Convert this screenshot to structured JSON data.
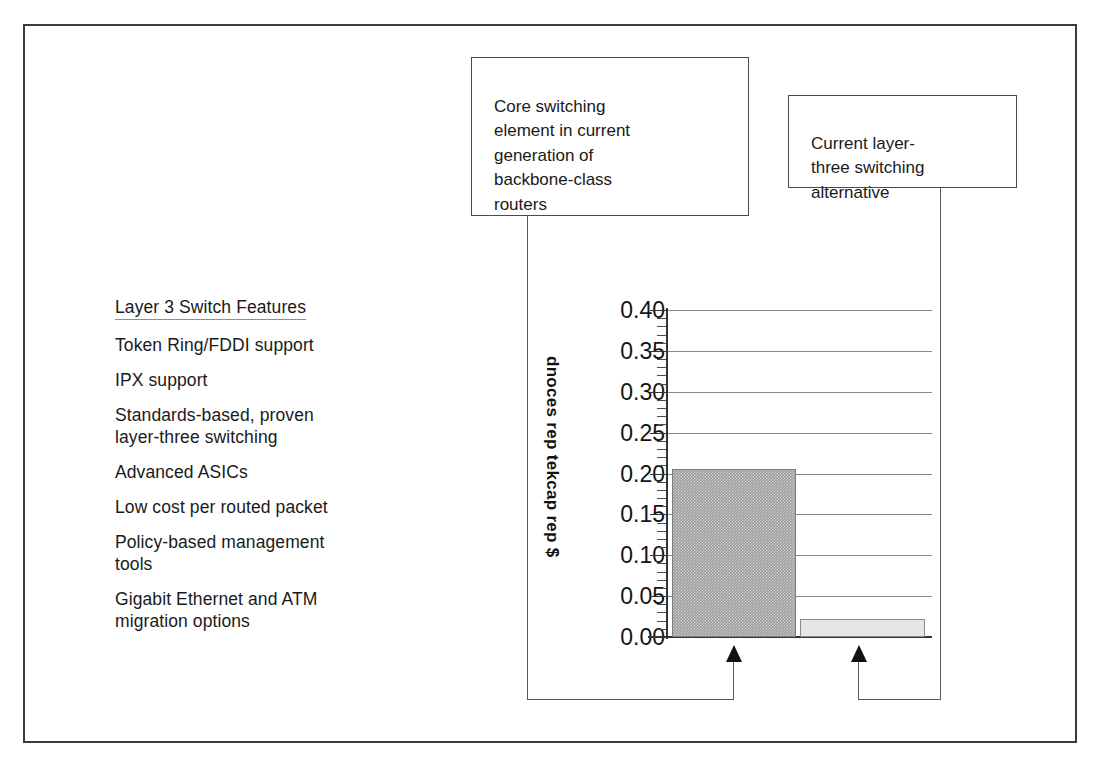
{
  "slide": {
    "background_color": "#ffffff",
    "frame_color": "#3b3b3b"
  },
  "feature_list": {
    "heading": "Layer 3 Switch Features",
    "items": [
      "Token Ring/FDDI support",
      "IPX support",
      "Standards-based, proven\nlayer-three switching",
      "Advanced    ASICs",
      "Low cost per routed packet",
      "Policy-based management\ntools",
      "Gigabit Ethernet and ATM\nmigration options"
    ]
  },
  "callouts": [
    {
      "id": "core",
      "text": "Core switching\nelement in current\ngeneration of\nbackbone-class\nrouters"
    },
    {
      "id": "current",
      "text": "Current layer-\nthree switching\nalternative"
    }
  ],
  "chart_data": {
    "type": "bar",
    "title": "",
    "xlabel": "",
    "ylabel": "dnoces rep tekcap rep $",
    "ylabel_reading": "$ per packet per second",
    "ylim": [
      0.0,
      0.4
    ],
    "ytick_step": 0.05,
    "minor_tick_step": 0.01,
    "grid": true,
    "grid_axis": "y",
    "legend": "none",
    "categories": [
      "Core switching element in current generation of backbone-class routers",
      "Current layer-three switching alternative"
    ],
    "tick_labels": [
      "0.40",
      "0.35",
      "0.30",
      "0.25",
      "0.20",
      "0.15",
      "0.10",
      "0.05",
      "0.00"
    ],
    "values": [
      0.205,
      0.022
    ],
    "series": [
      {
        "name": "$ per packet per second",
        "values": [
          0.205,
          0.022
        ]
      }
    ],
    "bar_colors": [
      "#9c9c9c",
      "#e6e6e6"
    ],
    "bar_edge_colors": [
      "#7d7d7d",
      "#8c8c8c"
    ]
  },
  "annotations": {
    "arrow_core_label": "points-to-core-switching-bar",
    "arrow_alt_label": "points-to-layer-three-alternative-bar"
  }
}
